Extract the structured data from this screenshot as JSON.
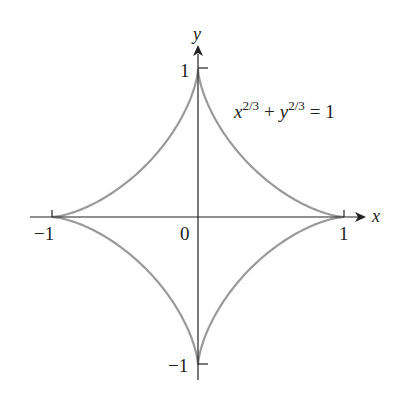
{
  "chart_data": {
    "type": "line",
    "title": "",
    "curve": "astroid",
    "equation": {
      "base1": "x",
      "exp1": "2/3",
      "plus": "+",
      "base2": "y",
      "exp2": "2/3",
      "rhs": "= 1"
    },
    "xlabel": "x",
    "ylabel": "y",
    "xlim": [
      -1,
      1
    ],
    "ylim": [
      -1,
      1
    ],
    "x_ticks": [
      "−1",
      "1"
    ],
    "y_ticks": [
      "1",
      "−1"
    ],
    "origin_label": "0",
    "grid": false,
    "curve_color": "#9a9a9a",
    "axis_color": "#222222"
  }
}
